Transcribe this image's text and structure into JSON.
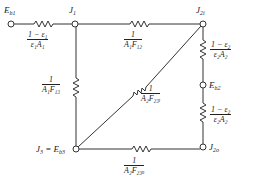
{
  "nodes": {
    "eb1": {
      "label": "E",
      "sub": "b1"
    },
    "j1": {
      "label": "J",
      "sub": "1"
    },
    "j2i": {
      "label": "J",
      "sub": "2i"
    },
    "eb2": {
      "label": "E",
      "sub": "b2"
    },
    "j2o": {
      "label": "J",
      "sub": "2o"
    },
    "j3": {
      "label": "J",
      "sub": "3",
      "eq": " = E",
      "eq_sub": "b3"
    }
  },
  "resistors": {
    "r_surface1": {
      "num": "1 − ε₁",
      "den": "ε₁A₁"
    },
    "r_12": {
      "num": "1",
      "den": "A₁F₁₂"
    },
    "r_13": {
      "num": "1",
      "den": "A₁F₁₃"
    },
    "r_23i": {
      "num": "1",
      "den": "A₂F₂₃ᵢ"
    },
    "r_surface2_top": {
      "num": "1 − ε₂",
      "den": "ε₂A₂"
    },
    "r_surface2_bottom": {
      "num": "1 − ε₂",
      "den": "ε₂A₂"
    },
    "r_23o": {
      "num": "1",
      "den": "A₂F₂₃ₒ"
    }
  }
}
